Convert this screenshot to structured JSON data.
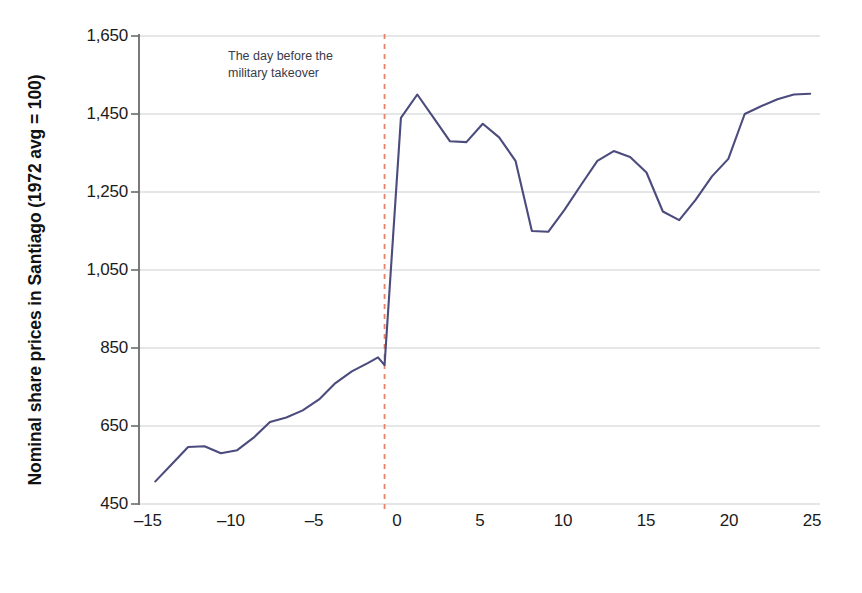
{
  "chart_data": {
    "type": "line",
    "title": "",
    "xlabel": "Trading days on Santiago stock market after military takeover",
    "ylabel": "Nominal share prices in Santiago (1972 avg = 100)",
    "xlim": [
      -16,
      25.6
    ],
    "ylim": [
      450,
      1650
    ],
    "xticks": [
      -15,
      -10,
      -5,
      0,
      5,
      10,
      15,
      20,
      25
    ],
    "xtick_labels": [
      "–15",
      "–10",
      "–5",
      "0",
      "5",
      "10",
      "15",
      "20",
      "25"
    ],
    "yticks": [
      450,
      650,
      850,
      1050,
      1250,
      1450,
      1650
    ],
    "ytick_labels": [
      "450",
      "650",
      "850",
      "1,050",
      "1,250",
      "1,450",
      "1,650"
    ],
    "grid": "horizontal",
    "legend": "none",
    "series": [
      {
        "name": "Nominal share prices in Santiago",
        "color": "#4b4b7d",
        "x": [
          -15,
          -14,
          -13,
          -12,
          -11,
          -10,
          -9,
          -8,
          -7,
          -6,
          -5,
          -4,
          -3,
          -2,
          -1.4,
          -1,
          0,
          1,
          2,
          3,
          4,
          5,
          6,
          7,
          8,
          9,
          10,
          11,
          12,
          13,
          14,
          15,
          16,
          17,
          18,
          19,
          20,
          21,
          22,
          23,
          24,
          25
        ],
        "values": [
          508,
          552,
          596,
          598,
          580,
          588,
          620,
          660,
          672,
          690,
          718,
          760,
          790,
          812,
          826,
          806,
          1440,
          1500,
          1440,
          1380,
          1378,
          1425,
          1390,
          1330,
          1150,
          1148,
          1205,
          1268,
          1330,
          1355,
          1340,
          1300,
          1200,
          1178,
          1230,
          1290,
          1335,
          1450,
          1470,
          1488,
          1500,
          1502
        ]
      }
    ],
    "reference_line": {
      "name": "day-before-military-takeover",
      "x": -1,
      "color": "#e8836a",
      "style": "dashed",
      "label_line1": "The day before the",
      "label_line2": "military takeover"
    },
    "axis_color": "#5a5a5a",
    "grid_color": "#c9cdd2",
    "background": "#ffffff"
  }
}
